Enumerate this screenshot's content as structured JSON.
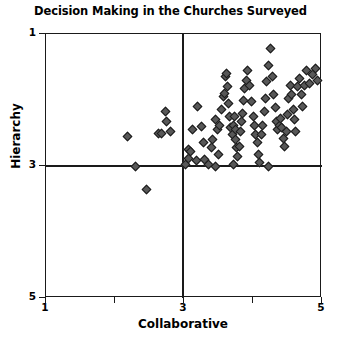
{
  "chart_data": {
    "type": "scatter",
    "title": "Decision Making in the Churches Surveyed",
    "xlabel": "Collaborative",
    "ylabel": "Hierarchy",
    "xlim": [
      1,
      5
    ],
    "ylim": [
      1,
      5
    ],
    "xticks": [
      1,
      2,
      3,
      4,
      5
    ],
    "yticks": [
      1,
      3,
      5
    ],
    "xticklabels": [
      "1",
      "",
      "3",
      "",
      "5"
    ],
    "yticklabels": [
      "5",
      "3",
      "1"
    ],
    "grid": false,
    "legend": null,
    "reference_lines": {
      "vertical_x": 3,
      "horizontal_y": 3,
      "note": "Quadrant divider lines at Collaborative = 3 and Hierarchy = 3"
    },
    "marker": {
      "shape": "diamond",
      "fill_color": "#585858",
      "edge_color": "#1a1a1a",
      "size_px": 7
    },
    "n_points": 95,
    "points": [
      [
        2.18,
        3.45
      ],
      [
        2.63,
        3.5
      ],
      [
        2.68,
        3.5
      ],
      [
        2.8,
        3.52
      ],
      [
        2.73,
        3.82
      ],
      [
        2.75,
        3.68
      ],
      [
        2.3,
        3.0
      ],
      [
        2.45,
        2.64
      ],
      [
        3.06,
        3.25
      ],
      [
        3.06,
        3.12
      ],
      [
        3.13,
        3.55
      ],
      [
        3.2,
        3.9
      ],
      [
        3.25,
        3.6
      ],
      [
        3.28,
        3.35
      ],
      [
        3.3,
        3.1
      ],
      [
        3.35,
        3.02
      ],
      [
        3.4,
        3.28
      ],
      [
        3.42,
        3.4
      ],
      [
        3.45,
        3.7
      ],
      [
        3.48,
        3.55
      ],
      [
        3.5,
        3.18
      ],
      [
        3.52,
        3.62
      ],
      [
        3.55,
        3.85
      ],
      [
        3.57,
        4.05
      ],
      [
        3.58,
        4.1
      ],
      [
        3.6,
        4.35
      ],
      [
        3.62,
        4.4
      ],
      [
        3.63,
        4.2
      ],
      [
        3.64,
        3.95
      ],
      [
        3.66,
        3.75
      ],
      [
        3.68,
        3.58
      ],
      [
        3.7,
        3.48
      ],
      [
        3.72,
        3.62
      ],
      [
        3.73,
        3.75
      ],
      [
        3.74,
        3.55
      ],
      [
        3.75,
        3.4
      ],
      [
        3.76,
        3.28
      ],
      [
        3.78,
        3.15
      ],
      [
        3.8,
        3.3
      ],
      [
        3.82,
        3.52
      ],
      [
        3.84,
        3.68
      ],
      [
        3.85,
        3.8
      ],
      [
        3.86,
        4.0
      ],
      [
        3.88,
        4.18
      ],
      [
        3.9,
        4.3
      ],
      [
        3.92,
        4.45
      ],
      [
        3.95,
        4.22
      ],
      [
        3.98,
        3.98
      ],
      [
        4.0,
        3.75
      ],
      [
        4.02,
        3.62
      ],
      [
        4.04,
        3.48
      ],
      [
        4.06,
        3.35
      ],
      [
        4.08,
        3.18
      ],
      [
        4.1,
        3.05
      ],
      [
        4.12,
        3.48
      ],
      [
        4.14,
        3.62
      ],
      [
        4.16,
        3.82
      ],
      [
        4.18,
        4.02
      ],
      [
        4.2,
        4.28
      ],
      [
        4.22,
        4.52
      ],
      [
        4.25,
        4.78
      ],
      [
        4.28,
        4.35
      ],
      [
        4.3,
        4.08
      ],
      [
        4.32,
        3.88
      ],
      [
        4.34,
        3.68
      ],
      [
        4.36,
        3.55
      ],
      [
        4.38,
        3.62
      ],
      [
        4.4,
        3.72
      ],
      [
        4.42,
        3.58
      ],
      [
        4.44,
        3.42
      ],
      [
        4.46,
        3.3
      ],
      [
        4.48,
        3.52
      ],
      [
        4.5,
        3.78
      ],
      [
        4.52,
        4.02
      ],
      [
        4.54,
        4.22
      ],
      [
        4.56,
        4.08
      ],
      [
        4.58,
        3.85
      ],
      [
        4.6,
        3.7
      ],
      [
        4.62,
        3.52
      ],
      [
        4.65,
        4.2
      ],
      [
        4.68,
        4.32
      ],
      [
        4.7,
        4.08
      ],
      [
        4.72,
        3.9
      ],
      [
        4.75,
        4.22
      ],
      [
        4.78,
        4.45
      ],
      [
        4.82,
        4.25
      ],
      [
        4.86,
        4.38
      ],
      [
        4.9,
        4.48
      ],
      [
        4.94,
        4.3
      ],
      [
        3.1,
        3.22
      ],
      [
        3.02,
        3.02
      ],
      [
        3.45,
        2.99
      ],
      [
        4.22,
        3.0
      ],
      [
        3.18,
        3.08
      ],
      [
        3.72,
        3.02
      ]
    ]
  }
}
